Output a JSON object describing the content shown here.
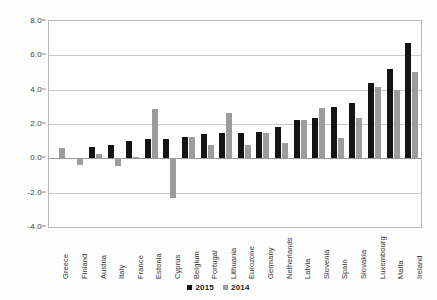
{
  "chart_data": {
    "type": "bar",
    "title": "",
    "subtitle": "",
    "xlabel": "",
    "ylabel": "",
    "ylim": [
      -4.0,
      8.0
    ],
    "ytick_labels": [
      "8.0",
      "6.0",
      "4.0",
      "2.0",
      "0.0",
      "-2.0",
      "-4.0"
    ],
    "ytick_values": [
      8.0,
      6.0,
      4.0,
      2.0,
      0.0,
      -2.0,
      -4.0
    ],
    "grid": true,
    "legend_position": "bottom",
    "categories": [
      "Greece",
      "Finland",
      "Austria",
      "Italy",
      "France",
      "Estonia",
      "Cyprus",
      "Belgium",
      "Portugal",
      "Lithuania",
      "Eurozone",
      "Germany",
      "Netherlands",
      "Latvia",
      "Slovenia",
      "Spain",
      "Slovakia",
      "Luxembourg",
      "Malta",
      "Ireland"
    ],
    "series": [
      {
        "name": "2015",
        "color": "#141414",
        "values": [
          0.0,
          0.0,
          0.65,
          0.75,
          1.0,
          1.1,
          1.1,
          1.25,
          1.4,
          1.45,
          1.5,
          1.55,
          1.85,
          2.25,
          2.35,
          3.0,
          3.25,
          4.4,
          5.2,
          6.7
        ]
      },
      {
        "name": "2014",
        "color": "#9c9c9c",
        "values": [
          0.6,
          -0.4,
          0.25,
          -0.45,
          0.1,
          2.85,
          -2.3,
          1.25,
          0.8,
          2.65,
          0.8,
          1.5,
          0.9,
          2.25,
          2.95,
          1.2,
          2.35,
          4.15,
          4.0,
          5.05
        ]
      }
    ]
  },
  "legend": {
    "items": [
      {
        "label": "2015",
        "color": "#141414"
      },
      {
        "label": "2014",
        "color": "#9c9c9c"
      }
    ]
  }
}
